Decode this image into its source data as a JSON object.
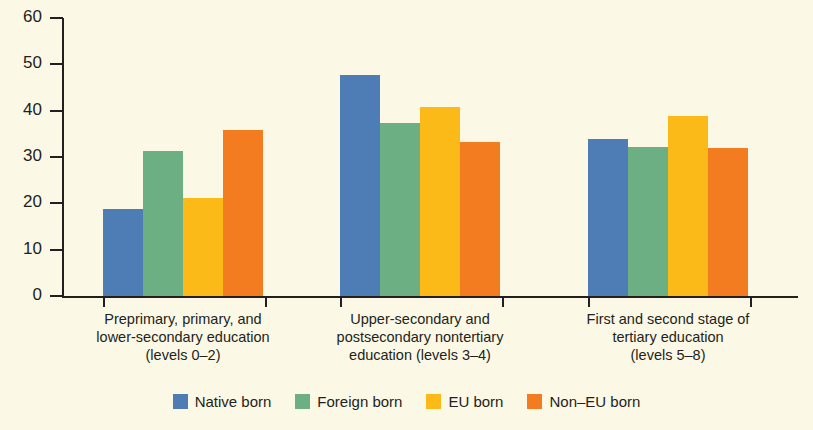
{
  "chart_data": {
    "type": "bar",
    "title": "",
    "subtitle": "",
    "xlabel": "",
    "ylabel": "",
    "ylim": [
      0,
      60
    ],
    "yticks": [
      0,
      10,
      20,
      30,
      40,
      50,
      60
    ],
    "ytick_labels": [
      "0",
      "10",
      "20",
      "30",
      "40",
      "50",
      "60"
    ],
    "grid": false,
    "legend_position": "bottom",
    "categories": [
      "Preprimary, primary, and lower-secondary education (levels 0–2)",
      "Upper-secondary and postsecondary nontertiary education (levels 3–4)",
      "First and second stage of tertiary education (levels 5–8)"
    ],
    "category_lines": [
      [
        "Preprimary, primary, and",
        "lower-secondary education",
        "(levels 0–2)"
      ],
      [
        "Upper-secondary and",
        "postsecondary nontertiary",
        "education (levels 3–4)"
      ],
      [
        "First and second stage of",
        "tertiary education",
        "(levels 5–8)"
      ]
    ],
    "series": [
      {
        "name": "Native born",
        "color": "#4E7CB5",
        "values": [
          18.7,
          47.8,
          33.9
        ]
      },
      {
        "name": "Foreign born",
        "color": "#6CAF83",
        "values": [
          31.2,
          37.3,
          32.1
        ]
      },
      {
        "name": "EU born",
        "color": "#FBBA17",
        "values": [
          21.2,
          40.9,
          38.8
        ]
      },
      {
        "name": "Non–EU born",
        "color": "#F47C20",
        "values": [
          35.8,
          33.2,
          31.9
        ]
      }
    ]
  },
  "legend": {
    "items": [
      {
        "label": "Native born",
        "color": "#4E7CB5"
      },
      {
        "label": "Foreign born",
        "color": "#6CAF83"
      },
      {
        "label": "EU born",
        "color": "#FBBA17"
      },
      {
        "label": "Non–EU born",
        "color": "#F47C20"
      }
    ]
  },
  "colors": {
    "background": "#FBF8E6",
    "axis": "#231f20",
    "text": "#231f20",
    "native_born": "#4E7CB5",
    "foreign_born": "#6CAF83",
    "eu_born": "#FBBA17",
    "non_eu_born": "#F47C20"
  }
}
